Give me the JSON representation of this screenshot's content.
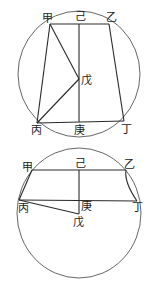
{
  "diagrams": [
    {
      "name": "top-figure",
      "labels": {
        "jia": "甲",
        "yi": "乙",
        "ji": "己",
        "wu": "戊",
        "bing": "丙",
        "geng": "庚",
        "ding": "丁"
      }
    },
    {
      "name": "bottom-figure",
      "labels": {
        "jia": "甲",
        "yi": "乙",
        "ji": "己",
        "wu": "戊",
        "bing": "丙",
        "geng": "庚",
        "ding": "丁"
      }
    }
  ]
}
